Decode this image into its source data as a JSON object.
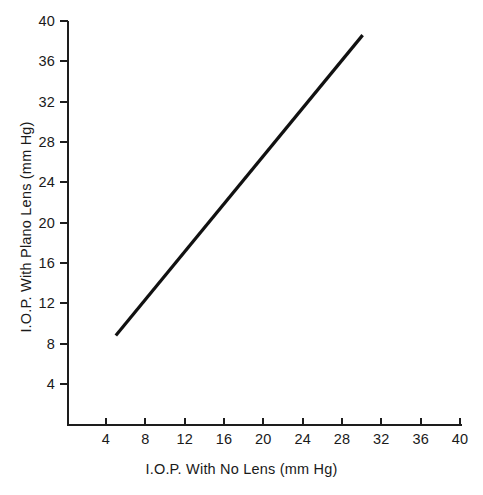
{
  "chart_data": {
    "type": "line",
    "title": "",
    "subtitle": "",
    "xlabel": "I.O.P. With No Lens (mm Hg)",
    "ylabel": "I.O.P. With Plano Lens (mm Hg)",
    "xlim": [
      0,
      41.2
    ],
    "ylim": [
      0,
      41.2
    ],
    "xticks": [
      4,
      8,
      12,
      16,
      20,
      24,
      28,
      32,
      36,
      40
    ],
    "yticks": [
      4,
      8,
      12,
      16,
      20,
      24,
      28,
      32,
      36,
      40
    ],
    "xticklabels": [
      "4",
      "8",
      "12",
      "16",
      "20",
      "24",
      "28",
      "32",
      "36",
      "40"
    ],
    "yticklabels": [
      "4",
      "8",
      "12",
      "16",
      "20",
      "24",
      "28",
      "32",
      "36",
      "40"
    ],
    "grid": false,
    "legend": null,
    "legend_position": "none",
    "annotations": [],
    "series": [
      {
        "name": "regression-line",
        "type": "line",
        "color": "#111111",
        "linewidth": 3.2,
        "x": [
          5.0,
          30.1
        ],
        "y": [
          8.8,
          38.6
        ]
      }
    ]
  },
  "axes": {
    "x": {
      "label": "I.O.P. With No Lens (mm Hg)",
      "ticks": [
        {
          "value": 4,
          "label": "4"
        },
        {
          "value": 8,
          "label": "8"
        },
        {
          "value": 12,
          "label": "12"
        },
        {
          "value": 16,
          "label": "16"
        },
        {
          "value": 20,
          "label": "20"
        },
        {
          "value": 24,
          "label": "24"
        },
        {
          "value": 28,
          "label": "28"
        },
        {
          "value": 32,
          "label": "32"
        },
        {
          "value": 36,
          "label": "36"
        },
        {
          "value": 40,
          "label": "40"
        }
      ]
    },
    "y": {
      "label": "I.O.P. With Plano Lens (mm Hg)",
      "ticks": [
        {
          "value": 40,
          "label": "40"
        },
        {
          "value": 36,
          "label": "36"
        },
        {
          "value": 32,
          "label": "32"
        },
        {
          "value": 28,
          "label": "28"
        },
        {
          "value": 24,
          "label": "24"
        },
        {
          "value": 20,
          "label": "20"
        },
        {
          "value": 16,
          "label": "16"
        },
        {
          "value": 12,
          "label": "12"
        },
        {
          "value": 8,
          "label": "8"
        },
        {
          "value": 4,
          "label": "4"
        }
      ]
    }
  },
  "colors": {
    "background": "#ffffff",
    "axis": "#1d1d1d",
    "text": "#1a1a1a",
    "series": "#111111"
  }
}
